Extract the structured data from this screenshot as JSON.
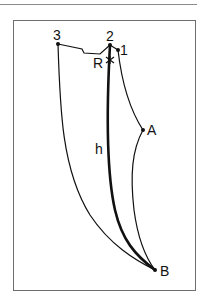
{
  "figure": {
    "labels": {
      "point_3": "3",
      "point_2": "2",
      "point_1": "1",
      "point_R": "R",
      "point_A": "A",
      "point_B": "B",
      "curve_h": "h"
    },
    "colors": {
      "stroke": "#111111",
      "frame": "#6e6e6e",
      "rule": "#8a8a8a"
    },
    "points": {
      "p3": [
        58,
        44
      ],
      "p2": [
        110,
        45
      ],
      "p1": [
        118,
        50
      ],
      "R": [
        110,
        60
      ],
      "A": [
        143,
        130
      ],
      "B": [
        155,
        270
      ]
    }
  }
}
